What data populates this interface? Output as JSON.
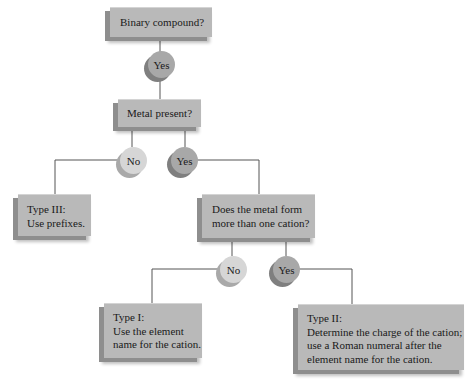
{
  "flowchart": {
    "nodes": {
      "binary": {
        "label": "Binary compound?"
      },
      "yes1": {
        "label": "Yes"
      },
      "metal": {
        "label": "Metal present?"
      },
      "no2": {
        "label": "No"
      },
      "yes2": {
        "label": "Yes"
      },
      "type3": {
        "label": "Type III:\nUse prefixes."
      },
      "cations": {
        "label": "Does the metal form\nmore than one cation?"
      },
      "no3": {
        "label": "No"
      },
      "yes3": {
        "label": "Yes"
      },
      "type1": {
        "label": "Type I:\nUse the element\nname for the cation."
      },
      "type2": {
        "label": "Type II:\nDetermine the charge of the cation;\nuse a Roman numeral after the\nelement name for the cation."
      }
    },
    "colors": {
      "box_face": "#b9b9b9",
      "box_side": "#8e8e8e",
      "no_circle": "#d6d6d6",
      "yes_circle": "#a8a8a8",
      "line": "#555555"
    }
  }
}
